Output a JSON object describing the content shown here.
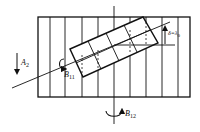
{
  "diagram": {
    "type": "mechanical-schematic",
    "colors": {
      "stroke": "#111111",
      "background": "#ffffff"
    },
    "labels": {
      "a2": {
        "main": "A",
        "sub": "2"
      },
      "b11": {
        "main": "B",
        "sub": "11"
      },
      "b12": {
        "main": "B",
        "sub": "12"
      },
      "delta": {
        "main": "δ=λ",
        "sub": "0"
      }
    },
    "elements": [
      "outer-rectangle-with-vertical-lines",
      "tilted-inner-rectangle-grid",
      "diagonal-axis-line",
      "vertical-center-axis",
      "horizontal-reference-line",
      "displacement-arrow-delta",
      "translation-arrow-A2",
      "rotation-arrow-B11",
      "rotation-arrow-B12"
    ]
  }
}
